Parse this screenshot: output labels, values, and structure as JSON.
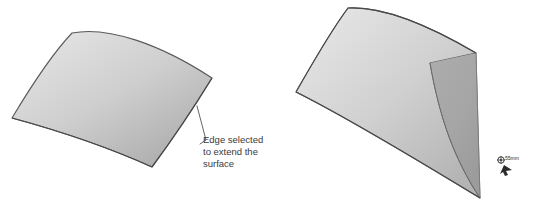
{
  "figure": {
    "background_color": "#ffffff",
    "panels": [
      {
        "id": "before",
        "name": "original-surface-panel",
        "surface_label": "original curved surface",
        "callout": {
          "lines": [
            "Edge selected",
            "to extend the",
            "surface"
          ],
          "line1": "Edge selected",
          "line2": "to extend the",
          "line3": "surface",
          "text_color": "#3a3a3a"
        },
        "colors": {
          "fill_light": "#d8d8d8",
          "fill_dark": "#a9a9a9",
          "outline": "#4a4a4a"
        }
      },
      {
        "id": "after",
        "name": "extended-surface-panel",
        "surface_label": "extended curved surface",
        "extension_label": "extended region",
        "measurement": {
          "value": "55mm",
          "cursor_label": "extend-drag-cursor"
        },
        "colors": {
          "fill_light": "#d8d8d8",
          "fill_dark": "#a9a9a9",
          "extension_fill": "#a6a6a6",
          "outline": "#4a4a4a"
        }
      }
    ]
  }
}
